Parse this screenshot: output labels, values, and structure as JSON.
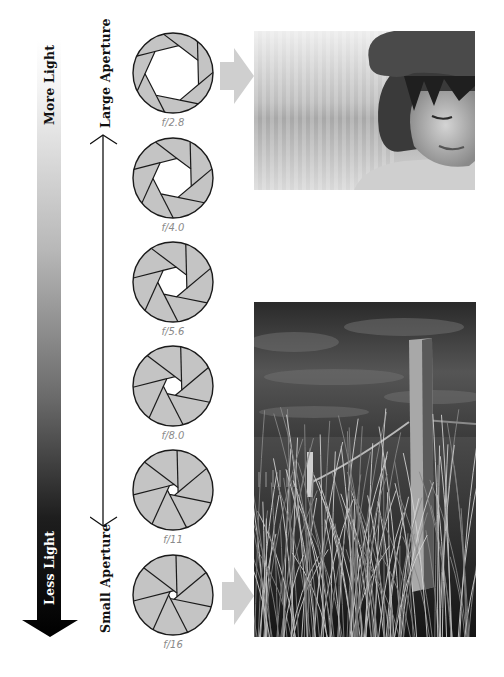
{
  "light_scale": {
    "top_label": "More Light",
    "bottom_label": "Less Light",
    "gradient_top": "#ffffff",
    "gradient_bottom": "#000000"
  },
  "aperture_scale": {
    "top_label": "Large Aperture",
    "bottom_label": "Small Aperture"
  },
  "apertures": [
    {
      "label": "f/2.8",
      "opening": 0.7
    },
    {
      "label": "f/4.0",
      "opening": 0.5
    },
    {
      "label": "f/5.6",
      "opening": 0.38
    },
    {
      "label": "f/8.0",
      "opening": 0.24
    },
    {
      "label": "f/11",
      "opening": 0.14
    },
    {
      "label": "f/16",
      "opening": 0.11
    }
  ],
  "colors": {
    "blade_fill": "#c4c4c4",
    "blade_stroke": "#1a1a1a",
    "pointer_arrow": "#cfcfcf",
    "fstop_text": "#8a8a8a"
  },
  "photos": {
    "top": {
      "description": "Shallow depth of field portrait of a child in a hat (black and white)"
    },
    "bottom": {
      "description": "Deep depth of field landscape of a wooden fence post in dune grass (black and white)"
    }
  }
}
